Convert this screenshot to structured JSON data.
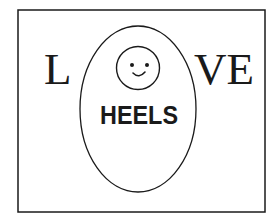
{
  "logo": {
    "letter_left": "L",
    "letters_right": "VE",
    "center_word": "HEELS",
    "smiley_icon": "smiley-face-icon",
    "colors": {
      "ink": "#1a1a1a",
      "background": "#ffffff"
    }
  }
}
